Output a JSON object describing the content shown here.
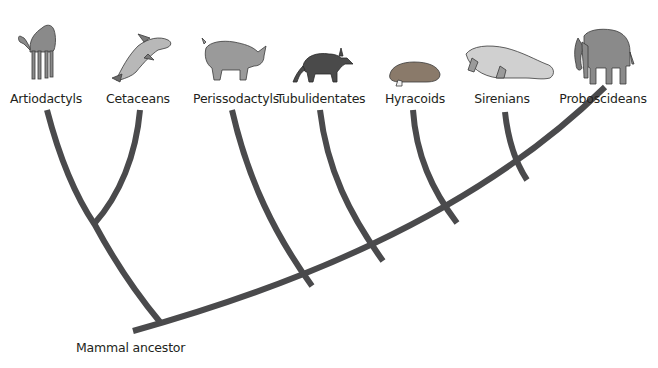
{
  "diagram": {
    "type": "cladogram",
    "root_label": "Mammal ancestor",
    "branch_color": "#4a4a4c",
    "taxa": [
      {
        "label": "Artiodactyls",
        "animal": "camel-icon",
        "x": 46
      },
      {
        "label": "Cetaceans",
        "animal": "dolphin-icon",
        "x": 138
      },
      {
        "label": "Perissodactyls",
        "animal": "rhinoceros-icon",
        "x": 236
      },
      {
        "label": "Tubulidentates",
        "animal": "aardvark-icon",
        "x": 321
      },
      {
        "label": "Hyracoids",
        "animal": "hyrax-icon",
        "x": 415
      },
      {
        "label": "Sirenians",
        "animal": "manatee-icon",
        "x": 502
      },
      {
        "label": "Proboscideans",
        "animal": "elephant-icon",
        "x": 603
      }
    ],
    "clades": [
      {
        "members": [
          "Artiodactyls",
          "Cetaceans"
        ]
      },
      {
        "members": [
          "Sirenians",
          "Proboscideans"
        ]
      },
      {
        "members": [
          "Hyracoids",
          "Sirenians",
          "Proboscideans"
        ]
      },
      {
        "members": [
          "Tubulidentates",
          "Hyracoids",
          "Sirenians",
          "Proboscideans"
        ]
      },
      {
        "members": [
          "Perissodactyls",
          "Tubulidentates",
          "Hyracoids",
          "Sirenians",
          "Proboscideans"
        ]
      }
    ]
  }
}
